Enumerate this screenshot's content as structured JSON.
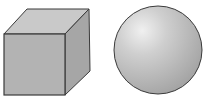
{
  "figure": {
    "shapes": [
      {
        "name": "cube",
        "label": "Cube"
      },
      {
        "name": "sphere",
        "label": "Sphere"
      }
    ]
  },
  "colors": {
    "background": "#ffffff",
    "outline": "#3a3a3a",
    "cube_front": "#b3b3b3",
    "cube_top": "#c9c9c9",
    "cube_side": "#a6a6a6",
    "sphere_highlight": "#eeeeee",
    "sphere_mid": "#bfbfbf",
    "sphere_shadow": "#a3a3a3"
  }
}
